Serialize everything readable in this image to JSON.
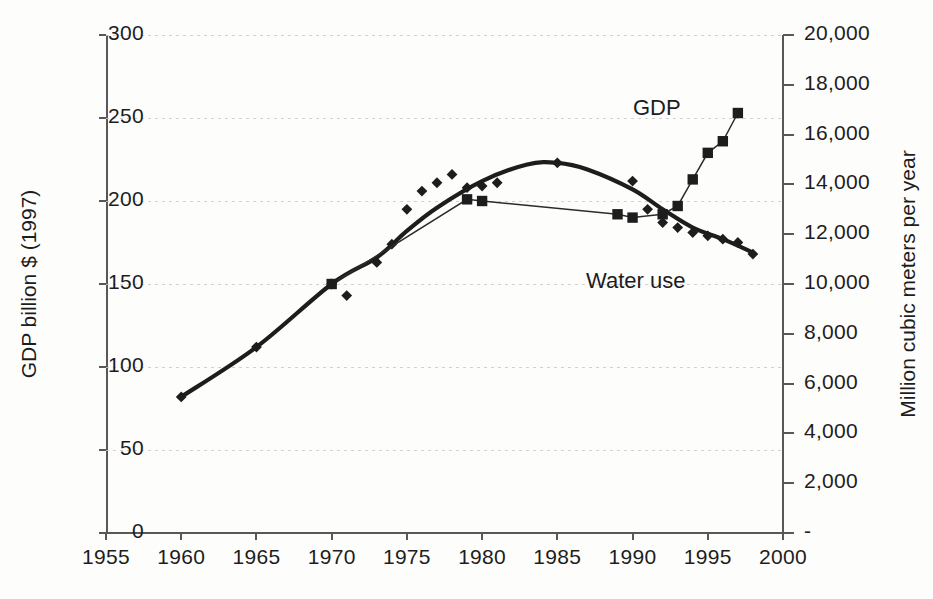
{
  "chart_data": {
    "type": "line",
    "title": "",
    "xlabel": "",
    "ylabel": "GDP billion $ (1997)",
    "y2label": "Million cubic meters per year",
    "xlim": [
      1955,
      2000
    ],
    "ylim": [
      0,
      300
    ],
    "y2lim": [
      0,
      20000
    ],
    "xticks": [
      "1955",
      "1960",
      "1965",
      "1970",
      "1975",
      "1980",
      "1985",
      "1990",
      "1995",
      "2000"
    ],
    "yticks": [
      "0",
      "50",
      "100",
      "150",
      "200",
      "250",
      "300"
    ],
    "y2ticks": [
      "-",
      "2,000",
      "4,000",
      "6,000",
      "8,000",
      "10,000",
      "12,000",
      "14,000",
      "16,000",
      "18,000",
      "20,000"
    ],
    "grid": "horizontal-dotted",
    "legend": "inline-annotations",
    "series": [
      {
        "name": "Water use",
        "axis": "right",
        "marker": "diamond",
        "line": "thick-smoothed-trend",
        "units": "million cubic meters per year",
        "x": [
          1960,
          1965,
          1970,
          1971,
          1973,
          1974,
          1975,
          1976,
          1977,
          1978,
          1979,
          1980,
          1981,
          1985,
          1990,
          1991,
          1992,
          1993,
          1994,
          1995,
          1996,
          1997,
          1998
        ],
        "values": [
          5500,
          7450,
          10000,
          9500,
          10850,
          11600,
          13000,
          13750,
          14100,
          14400,
          13900,
          13950,
          14050,
          14900,
          14150,
          13000,
          12500,
          12300,
          12100,
          11950,
          11800,
          11700,
          11250
        ],
        "values_left_scale": [
          82,
          112,
          150,
          143,
          163,
          174,
          195,
          206,
          211,
          216,
          208,
          209,
          211,
          223,
          212,
          195,
          187,
          184,
          181,
          179,
          177,
          175,
          168
        ]
      },
      {
        "name": "GDP",
        "axis": "left",
        "marker": "square",
        "line": "thin-connected",
        "units": "billion $ (1997)",
        "x": [
          1970,
          1979,
          1980,
          1989,
          1990,
          1992,
          1993,
          1994,
          1995,
          1996,
          1997
        ],
        "values": [
          150,
          201,
          200,
          192,
          190,
          192,
          197,
          213,
          229,
          236,
          253
        ]
      }
    ],
    "annotations": [
      {
        "text": "GDP",
        "x": 1993.0,
        "y": 262
      },
      {
        "text": "Water use",
        "x": 1989.5,
        "y": 155
      }
    ]
  },
  "figure": {
    "axis_title_left": "GDP billion $ (1997)",
    "axis_title_right": "Million cubic meters per year",
    "label_gdp": "GDP",
    "label_water": "Water use",
    "caption": ""
  }
}
